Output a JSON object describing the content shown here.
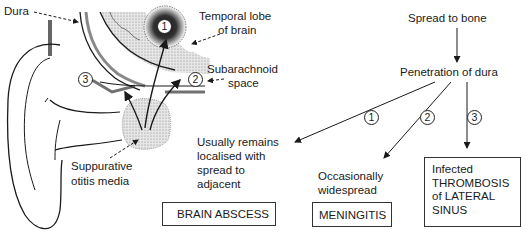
{
  "illustration": {
    "labels": {
      "dura": "Dura",
      "temporal_lobe": [
        "Temporal lobe",
        "of brain"
      ],
      "subarachnoid": [
        "Subarachnoid",
        "space"
      ],
      "otitis": [
        "Suppurative",
        "otitis media"
      ]
    },
    "markers": [
      "1",
      "2",
      "3"
    ]
  },
  "flow": {
    "start": "Spread to bone",
    "step": "Penetration of dura",
    "branches": [
      {
        "marker": "1",
        "description": [
          "Usually remains",
          "localised with",
          "spread to",
          "adjacent"
        ],
        "outcome": "BRAIN ABSCESS"
      },
      {
        "marker": "2",
        "description": [
          "Occasionally",
          "widespread"
        ],
        "outcome": "MENINGITIS"
      },
      {
        "marker": "3",
        "description": [],
        "outcome": [
          "Infected",
          "THROMBOSIS",
          "of LATERAL",
          "SINUS"
        ]
      }
    ]
  },
  "colors": {
    "ink": "#1a1a1a",
    "stipple": "#d9d9d9",
    "background": "#ffffff"
  }
}
